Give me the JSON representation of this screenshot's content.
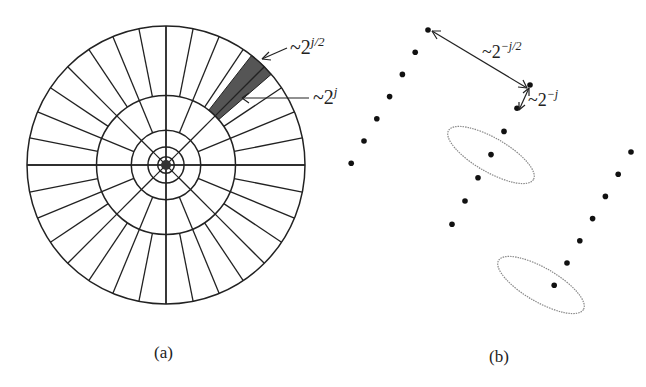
{
  "panel_a": {
    "caption": "(a)",
    "spoke_count": 32,
    "ring_fractions": [
      1.0,
      0.5,
      0.25,
      0.13,
      0.06
    ],
    "shaded_wedge_color": "#555555",
    "annotations": [
      {
        "id": "width",
        "base": "~2",
        "exp": "j/2"
      },
      {
        "id": "length",
        "base": "~2",
        "exp": "j"
      }
    ]
  },
  "panel_b": {
    "caption": "(b)",
    "annotations": [
      {
        "id": "spacing-long",
        "base": "~2",
        "exp": "−j/2"
      },
      {
        "id": "spacing-short",
        "base": "~2",
        "exp": "−j"
      }
    ],
    "dot_rows": 3,
    "dots_per_row": 7,
    "ellipse_count": 2
  }
}
